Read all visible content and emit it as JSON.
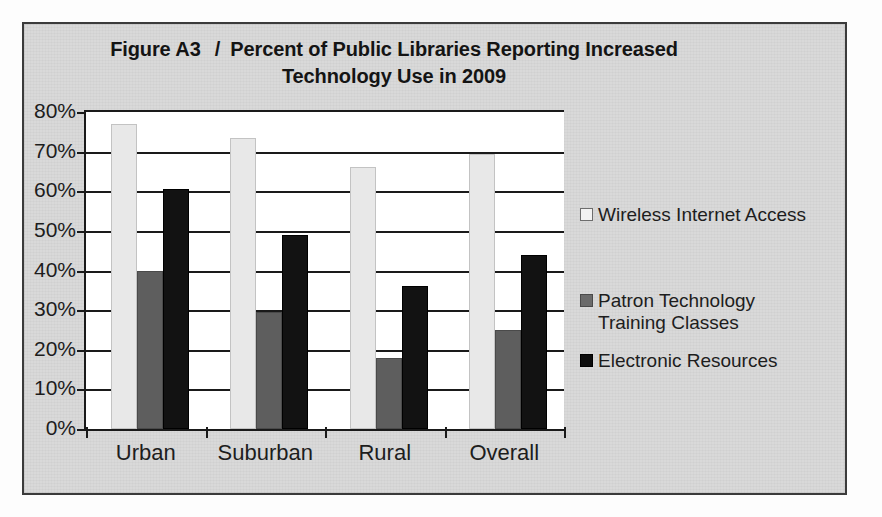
{
  "figure": {
    "number": "Figure A3",
    "separator": "/",
    "title_line1": "Percent of Public Libraries Reporting Increased",
    "title_line2": "Technology Use in 2009"
  },
  "chart_data": {
    "type": "bar",
    "xlabel": "",
    "ylabel": "",
    "ylim": [
      0,
      80
    ],
    "ytick_labels": [
      "80%",
      "70%",
      "60%",
      "50%",
      "40%",
      "30%",
      "20%",
      "10%",
      "0%"
    ],
    "ytick_values": [
      80,
      70,
      60,
      50,
      40,
      30,
      20,
      10,
      0
    ],
    "grid": true,
    "legend_position": "right",
    "categories": [
      "Urban",
      "Suburban",
      "Rural",
      "Overall"
    ],
    "series": [
      {
        "name": "Wireless Internet Access",
        "color": "#e8e8e8",
        "values": [
          77,
          73.5,
          66,
          69.5
        ]
      },
      {
        "name": "Patron Technology Training Classes",
        "color": "#5e5e5e",
        "values": [
          40,
          29.5,
          18,
          25
        ]
      },
      {
        "name": "Electronic Resources",
        "color": "#121212",
        "values": [
          60.5,
          49,
          36,
          44
        ]
      }
    ]
  },
  "legend": {
    "items": [
      {
        "label": "Wireless Internet Access",
        "swatch": "wireless"
      },
      {
        "label": "Patron Technology\nTraining Classes",
        "swatch": "patron"
      },
      {
        "label": "Electronic Resources",
        "swatch": "electronic"
      }
    ]
  },
  "colors": {
    "frame_border": "#3b3b3b",
    "figure_background": "#d9d9d9",
    "plot_background": "#ffffff",
    "axis": "#1a1a1a",
    "series_wireless": "#e8e8e8",
    "series_patron": "#5e5e5e",
    "series_electronic": "#121212"
  }
}
